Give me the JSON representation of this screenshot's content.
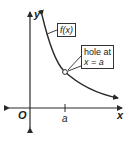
{
  "diagram": {
    "type": "function-graph",
    "axes": {
      "x_label": "x",
      "y_label": "y",
      "origin_label": "O",
      "tick_label": "a"
    },
    "callouts": {
      "function_label": "f(x)",
      "hole_line1": "hole at",
      "hole_line2": "x = a"
    },
    "colors": {
      "line": "#2a2a2a",
      "background": "#ffffff"
    }
  }
}
